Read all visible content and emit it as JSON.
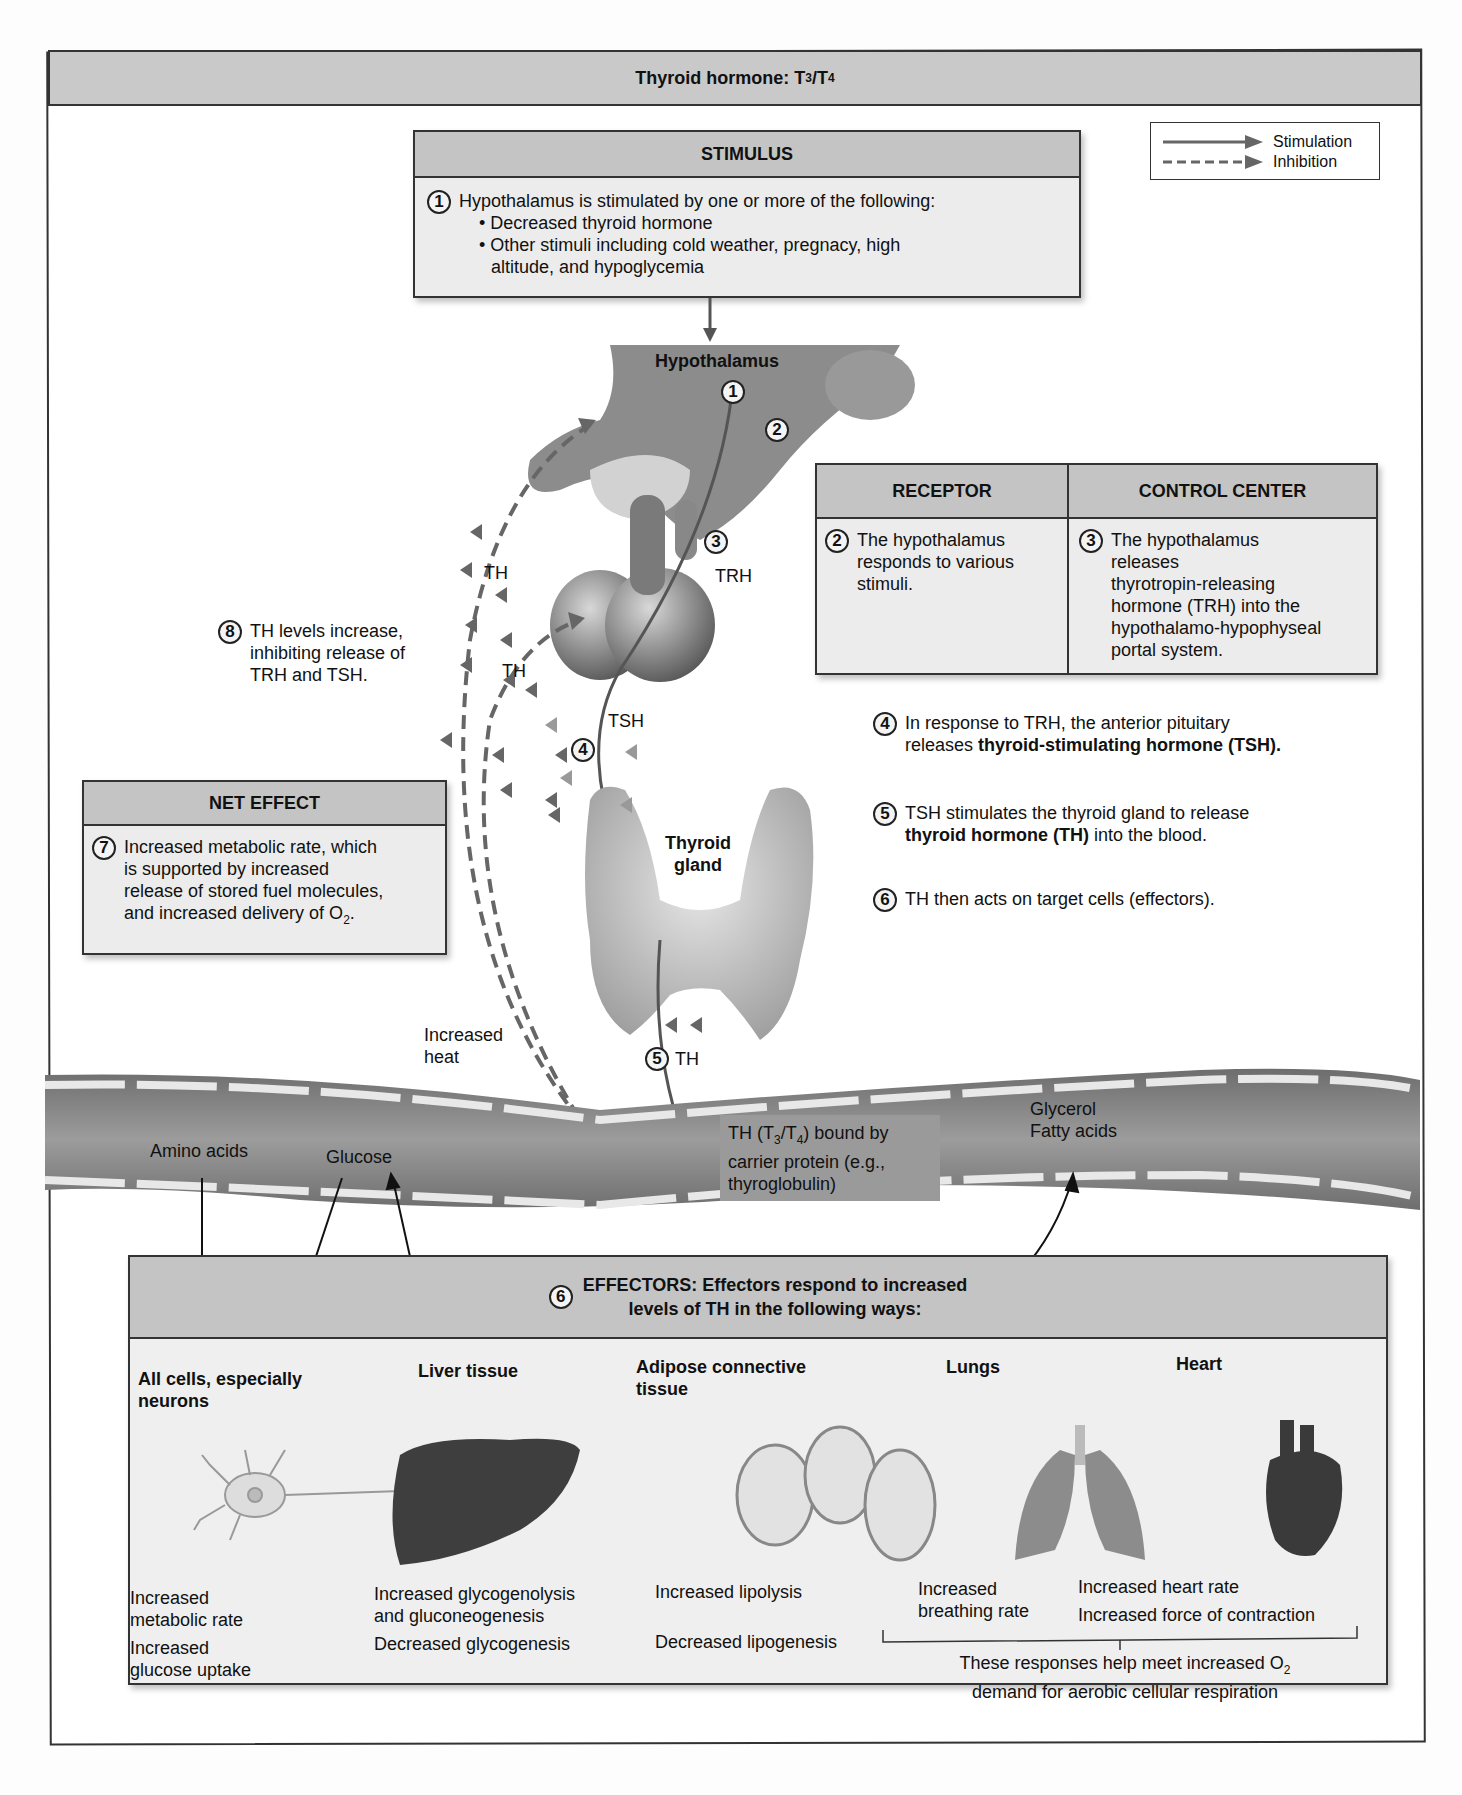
{
  "title": {
    "text": "Thyroid hormone: T",
    "sub1": "3",
    "slash": "/T",
    "sub2": "4"
  },
  "legend": {
    "stimulation": "Stimulation",
    "inhibition": "Inhibition"
  },
  "stimulus": {
    "heading": "STIMULUS",
    "number": "1",
    "intro": "Hypothalamus is stimulated by one or more of the following:",
    "bullets": [
      "• Decreased thyroid hormone",
      "• Other stimuli including cold weather, pregnacy, high",
      "altitude, and hypoglycemia"
    ]
  },
  "receptor": {
    "heading": "RECEPTOR",
    "number": "2",
    "lines": [
      "The hypothalamus",
      "responds to various",
      "stimuli."
    ]
  },
  "control_center": {
    "heading": "CONTROL CENTER",
    "number": "3",
    "lines": [
      "The hypothalamus",
      "releases",
      "thyrotropin-releasing",
      "hormone (TRH) into the",
      "hypothalamo-hypophyseal",
      "portal system."
    ]
  },
  "steps": {
    "s4": {
      "number": "4",
      "line1": "In response to TRH, the anterior pituitary",
      "line2_pre": "releases ",
      "line2_bold": "thyroid-stimulating hormone (TSH)."
    },
    "s5": {
      "number": "5",
      "line1": "TSH stimulates the thyroid gland to release",
      "line2_bold": "thyroid hormone (TH)",
      "line2_post": " into the blood."
    },
    "s6": {
      "number": "6",
      "line1": "TH then acts on target cells (effectors)."
    }
  },
  "net_effect": {
    "heading": "NET EFFECT",
    "number": "7",
    "lines": [
      "Increased metabolic rate, which",
      "is supported by increased",
      "release of stored fuel molecules,",
      "and increased delivery of O"
    ],
    "sub": "2",
    "end": "."
  },
  "feedback": {
    "number": "8",
    "lines": [
      "TH levels increase,",
      "inhibiting release of",
      "TRH and TSH."
    ]
  },
  "anatomy": {
    "hypothalamus": "Hypothalamus",
    "circle1": "1",
    "circle2": "2",
    "circle3": "3",
    "trh": "TRH",
    "th_upper": "TH",
    "th_lower": "TH",
    "tsh": "TSH",
    "circle4": "4",
    "thyroid_line1": "Thyroid",
    "thyroid_line2": "gland",
    "increased_heat_1": "Increased",
    "increased_heat_2": "heat",
    "circle5": "5",
    "th_blood": "TH"
  },
  "blood_vessel": {
    "amino_acids": "Amino acids",
    "glucose": "Glucose",
    "carrier_line1_a": "TH (T",
    "carrier_sub1": "3",
    "carrier_line1_b": "/T",
    "carrier_sub2": "4",
    "carrier_line1_c": ") bound by",
    "carrier_line2": "carrier protein (e.g.,",
    "carrier_line3": "thyroglobulin)",
    "glycerol": "Glycerol",
    "fatty_acids": "Fatty acids"
  },
  "effectors": {
    "number": "6",
    "heading_line1": "EFFECTORS: Effectors respond to increased",
    "heading_line2": "levels of TH in the following ways:",
    "columns": [
      {
        "title_line1": "All cells, especially",
        "title_line2": "neurons",
        "icon": "neuron-icon",
        "effects": [
          "Increased",
          "metabolic rate",
          "Increased",
          "glucose uptake"
        ]
      },
      {
        "title_line1": "Liver tissue",
        "title_line2": "",
        "icon": "liver-icon",
        "effects": [
          "Increased glycogenolysis",
          "and gluconeogenesis",
          "Decreased glycogenesis"
        ]
      },
      {
        "title_line1": "Adipose connective",
        "title_line2": "tissue",
        "icon": "adipose-cells-icon",
        "effects": [
          "Increased lipolysis",
          "Decreased lipogenesis"
        ]
      },
      {
        "title_line1": "Lungs",
        "title_line2": "",
        "icon": "lungs-icon",
        "effects": [
          "Increased",
          "breathing rate"
        ]
      },
      {
        "title_line1": "Heart",
        "title_line2": "",
        "icon": "heart-icon",
        "effects": [
          "Increased heart rate",
          "Increased force of contraction"
        ]
      }
    ],
    "summary_line1": "These responses help meet increased O",
    "summary_sub": "2",
    "summary_line2": "demand for aerobic cellular respiration"
  },
  "colors": {
    "header_gray": "#c4c4c4",
    "box_fill": "#ececec",
    "border": "#333333",
    "vessel": "#8a8a8a",
    "gland": "#a8a8a8",
    "arrow": "#555555"
  }
}
